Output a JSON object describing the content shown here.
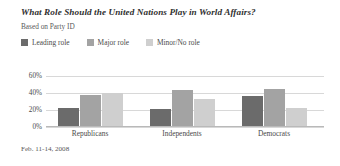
{
  "header": {
    "title": "What Role Should the United Nations Play in World Affairs?",
    "subtitle": "Based on Party ID"
  },
  "footer": {
    "date": "Feb. 11-14, 2008"
  },
  "legend": [
    {
      "label": "Leading role",
      "color": "#6b6b6b",
      "swatch_name": "legend-swatch-leading-role"
    },
    {
      "label": "Major role",
      "color": "#a3a3a3",
      "swatch_name": "legend-swatch-major-role"
    },
    {
      "label": "Minor/No role",
      "color": "#cfcfcf",
      "swatch_name": "legend-swatch-minor-no-role"
    }
  ],
  "axis": {
    "ticks": [
      "60%",
      "40%",
      "20%",
      "0%"
    ]
  },
  "chart_data": {
    "type": "bar",
    "title": "What Role Should the United Nations Play in World Affairs?",
    "subtitle": "Based on Party ID",
    "xlabel": "",
    "ylabel": "",
    "ylim": [
      0,
      60
    ],
    "yticks": [
      0,
      20,
      40,
      60
    ],
    "ytick_labels": [
      "0%",
      "20%",
      "40%",
      "60%"
    ],
    "grid": true,
    "legend_position": "top-left",
    "categories": [
      "Republicans",
      "Independents",
      "Democrats"
    ],
    "series": [
      {
        "name": "Leading role",
        "color": "#6b6b6b",
        "values": [
          22,
          21,
          37
        ]
      },
      {
        "name": "Major role",
        "color": "#a3a3a3",
        "values": [
          38,
          44,
          45
        ]
      },
      {
        "name": "Minor/No role",
        "color": "#cfcfcf",
        "values": [
          40,
          33,
          22
        ]
      }
    ],
    "note": "Feb. 11-14, 2008"
  }
}
